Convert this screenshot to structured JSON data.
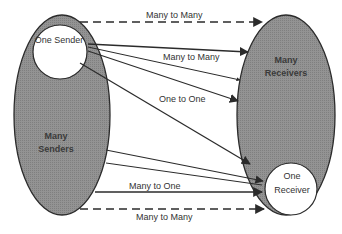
{
  "diagram": {
    "colors": {
      "ellipse_fill": "#8f8f8f",
      "stroke": "#2b2b2b",
      "circle_fill": "#ffffff",
      "text": "#333333"
    },
    "nodes": {
      "many_senders": {
        "label_line1": "Many",
        "label_line2": "Senders"
      },
      "one_sender": {
        "label": "One Sender"
      },
      "many_receivers": {
        "label_line1": "Many",
        "label_line2": "Receivers"
      },
      "one_receiver": {
        "label_line1": "One",
        "label_line2": "Receiver"
      }
    },
    "edges": [
      {
        "id": "top-dashed",
        "from": "many_senders",
        "to": "many_receivers",
        "style": "dashed",
        "label": "Many to Many"
      },
      {
        "id": "one-sender-many",
        "from": "one_sender",
        "to": "many_receivers",
        "style": "solid",
        "label": "Many to Many"
      },
      {
        "id": "one-to-one",
        "from": "one_sender",
        "to": "one_receiver",
        "style": "solid",
        "label": "One to One"
      },
      {
        "id": "many-to-one",
        "from": "many_senders",
        "to": "one_receiver",
        "style": "solid",
        "label": "Many to One"
      },
      {
        "id": "bottom-dashed",
        "from": "many_senders",
        "to": "many_receivers",
        "style": "dashed",
        "label": "Many to Many"
      }
    ]
  }
}
